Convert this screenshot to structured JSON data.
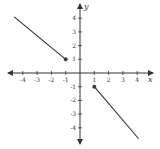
{
  "chart_data": {
    "type": "line",
    "title": "",
    "xlabel": "x",
    "ylabel": "y",
    "xlim": [
      -5,
      5
    ],
    "ylim": [
      -5,
      5
    ],
    "grid": false,
    "x_ticks": [
      -4,
      -3,
      -2,
      -1,
      1,
      2,
      3,
      4
    ],
    "y_ticks": [
      4,
      3,
      2,
      1,
      -1,
      -2,
      -3,
      -4
    ],
    "x_tick_labels": [
      "-4",
      "-3",
      "-2",
      "-1",
      "1",
      "2",
      "3",
      "4"
    ],
    "y_tick_labels": [
      "4",
      "3",
      "2",
      "1",
      "-1",
      "-2",
      "-3",
      "-4"
    ],
    "series": [
      {
        "name": "left-segment",
        "x": [
          -4.6,
          -1
        ],
        "y": [
          4.1,
          1
        ],
        "endpoint": {
          "x": -1,
          "y": 1,
          "style": "closed"
        }
      },
      {
        "name": "right-segment",
        "x": [
          1,
          4.1
        ],
        "y": [
          -1,
          -4.8
        ],
        "endpoint": {
          "x": 1,
          "y": -1,
          "style": "closed"
        }
      }
    ],
    "colors": {
      "line": "#333333",
      "axis": "#333333"
    }
  }
}
